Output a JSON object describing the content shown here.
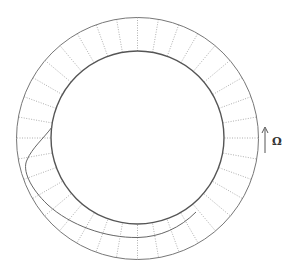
{
  "diagram": {
    "rotation_label": "Ω",
    "rotation_direction": "counterclockwise-up",
    "radial_line_count": 36,
    "colors": {
      "outer_circle": "#777777",
      "inner_circle": "#555555",
      "radial_lines": "#9a9a9a",
      "spiral": "#666666",
      "arrow": "#555555",
      "label": "#333333"
    }
  }
}
